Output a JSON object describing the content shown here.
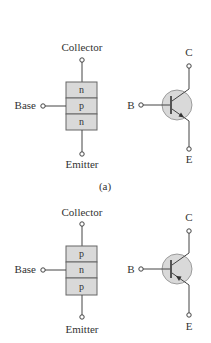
{
  "figure": {
    "caption_a": "(a)",
    "colors": {
      "layer_fill": "#d9d9d9",
      "line": "#444444",
      "text": "#333333"
    }
  },
  "npn": {
    "block": {
      "collector_label": "Collector",
      "base_label": "Base",
      "emitter_label": "Emitter",
      "layers": [
        "n",
        "p",
        "n"
      ]
    },
    "symbol": {
      "c_label": "C",
      "b_label": "B",
      "e_label": "E",
      "arrow_direction": "out"
    }
  },
  "pnp": {
    "block": {
      "collector_label": "Collector",
      "base_label": "Base",
      "emitter_label": "Emitter",
      "layers": [
        "p",
        "n",
        "p"
      ]
    },
    "symbol": {
      "c_label": "C",
      "b_label": "B",
      "e_label": "E",
      "arrow_direction": "in"
    }
  }
}
